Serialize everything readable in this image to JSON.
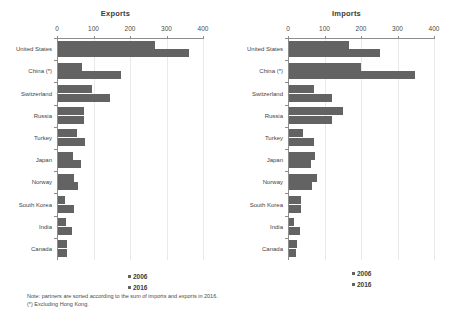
{
  "chart_data": {
    "type": "bar",
    "orientation": "horizontal",
    "grid": true,
    "legend_position": "bottom-center",
    "xlim": [
      0,
      400
    ],
    "xticks": [
      0,
      100,
      200,
      300,
      400
    ],
    "xlabel": "",
    "ylabel": "",
    "categories": [
      "United States",
      "China (*)",
      "Switzerland",
      "Russia",
      "Turkey",
      "Japan",
      "Norway",
      "South Korea",
      "India",
      "Canada"
    ],
    "series_names": [
      "2006",
      "2016"
    ],
    "panels": [
      {
        "title": "Exports",
        "series": [
          {
            "name": "2006",
            "values": [
              265,
              65,
              92,
              70,
              52,
              42,
              45,
              18,
              22,
              25
            ]
          },
          {
            "name": "2016",
            "values": [
              360,
              172,
              142,
              72,
              75,
              62,
              55,
              45,
              38,
              25
            ]
          }
        ]
      },
      {
        "title": "Imports",
        "series": [
          {
            "name": "2006",
            "values": [
              165,
              196,
              68,
              148,
              38,
              72,
              78,
              32,
              14,
              22
            ]
          },
          {
            "name": "2016",
            "values": [
              248,
              345,
              118,
              117,
              68,
              60,
              63,
              32,
              30,
              18
            ]
          }
        ]
      }
    ],
    "colors": {
      "2006": "#636363",
      "2016": "#636363"
    },
    "notes": [
      "Note: partners are sorted according to the sum of imports and exports in 2016.",
      "(*) Excluding Hong Kong."
    ]
  }
}
